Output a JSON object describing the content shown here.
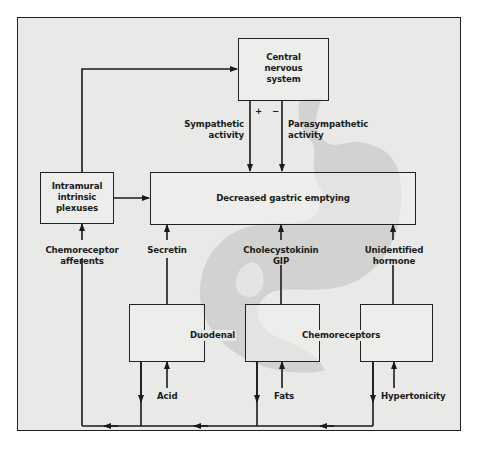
{
  "diagram": {
    "type": "flowchart",
    "topic": "Regulation of gastric emptying",
    "colors": {
      "background": "#e9e9e7",
      "stroke": "#222222",
      "stomach_silhouette": "#cfcfcd",
      "box_fill": "#f0f0ee"
    },
    "nodes": {
      "cns": {
        "label_line1": "Central",
        "label_line2": "nervous",
        "label_line3": "system"
      },
      "plexuses": {
        "label_line1": "Intramural",
        "label_line2": "intrinsic",
        "label_line3": "plexuses"
      },
      "main": {
        "label": "Decreased gastric emptying"
      },
      "duodenal_label": "Duodenal",
      "chemoreceptors_label": "Chemoreceptors"
    },
    "edge_labels": {
      "sympathetic_line1": "Sympathetic",
      "sympathetic_line2": "activity",
      "parasympathetic_line1": "Parasympathetic",
      "parasympathetic_line2": "activity",
      "plus": "+",
      "minus": "−",
      "chemo_afferents_line1": "Chemoreceptor",
      "chemo_afferents_line2": "afferents",
      "secretin": "Secretin",
      "cck_line1": "Cholecystokinin",
      "cck_line2": "GIP",
      "unidentified_line1": "Unidentified",
      "unidentified_line2": "hormone",
      "acid": "Acid",
      "fats": "Fats",
      "hypertonicity": "Hypertonicity"
    },
    "edges": [
      {
        "from": "Intramural intrinsic plexuses",
        "to": "Central nervous system"
      },
      {
        "from": "Intramural intrinsic plexuses",
        "to": "Decreased gastric emptying"
      },
      {
        "from": "Central nervous system",
        "to": "Decreased gastric emptying",
        "label": "Sympathetic activity (+)"
      },
      {
        "from": "Central nervous system",
        "to": "Decreased gastric emptying",
        "label": "Parasympathetic activity (-)"
      },
      {
        "from": "Duodenal chemoreceptors (acid)",
        "to": "Decreased gastric emptying",
        "label": "Secretin"
      },
      {
        "from": "Duodenal chemoreceptors (fats)",
        "to": "Decreased gastric emptying",
        "label": "Cholecystokinin GIP"
      },
      {
        "from": "Duodenal chemoreceptors (hypertonicity)",
        "to": "Decreased gastric emptying",
        "label": "Unidentified hormone"
      },
      {
        "from": "Duodenal chemoreceptors",
        "to": "Intramural intrinsic plexuses",
        "label": "Chemoreceptor afferents"
      },
      {
        "from": "Acid",
        "to": "Duodenal chemoreceptor box 1"
      },
      {
        "from": "Fats",
        "to": "Duodenal chemoreceptor box 2"
      },
      {
        "from": "Hypertonicity",
        "to": "Duodenal chemoreceptor box 3"
      }
    ]
  }
}
